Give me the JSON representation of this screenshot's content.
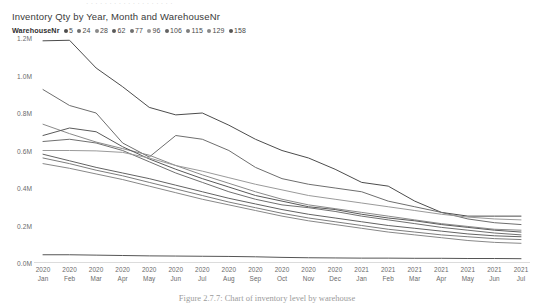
{
  "top_cut_text": "· · · · · · · · · · · · · · · · · · ·",
  "caption": "Figure 2.7.7: Chart of inventory level by warehouse",
  "chart": {
    "title": "Inventory Qty by Year, Month and WarehouseNr",
    "legend_title": "WarehouseNr"
  },
  "chart_data": {
    "type": "line",
    "title": "Inventory Qty by Year, Month and WarehouseNr",
    "xlabel": "",
    "ylabel": "",
    "ylim": [
      0,
      1200000
    ],
    "ytick_labels": [
      "1.2M",
      "1.0M",
      "0.8M",
      "0.6M",
      "0.4M",
      "0.2M",
      "0.0M"
    ],
    "ytick_values": [
      1200000,
      1000000,
      800000,
      600000,
      400000,
      200000,
      0
    ],
    "grid": false,
    "legend_position": "top-left",
    "legend_title": "WarehouseNr",
    "categories": [
      "2020 Jan",
      "2020 Feb",
      "2020 Mar",
      "2020 Apr",
      "2020 May",
      "2020 Jun",
      "2020 Jul",
      "2020 Aug",
      "2020 Sep",
      "2020 Oct",
      "2020 Nov",
      "2020 Dec",
      "2021 Jan",
      "2021 Feb",
      "2021 Mar",
      "2021 Apr",
      "2021 May",
      "2021 Jun",
      "2021 Jul"
    ],
    "x_tick_years": [
      "2020",
      "2020",
      "2020",
      "2020",
      "2020",
      "2020",
      "2020",
      "2020",
      "2020",
      "2020",
      "2020",
      "2020",
      "2021",
      "2021",
      "2021",
      "2021",
      "2021",
      "2021",
      "2021"
    ],
    "x_tick_months": [
      "Jan",
      "Feb",
      "Mar",
      "Apr",
      "May",
      "Jun",
      "Jul",
      "Aug",
      "Sep",
      "Oct",
      "Nov",
      "Dec",
      "Jan",
      "Feb",
      "Mar",
      "Apr",
      "May",
      "Jun",
      "Jul"
    ],
    "series": [
      {
        "name": "5",
        "color": "#4c4c4c",
        "values": [
          1185000,
          1188000,
          1040000,
          940000,
          830000,
          790000,
          800000,
          735000,
          660000,
          600000,
          560000,
          500000,
          430000,
          410000,
          330000,
          270000,
          250000,
          250000,
          250000
        ]
      },
      {
        "name": "24",
        "color": "#6e6e6e",
        "values": [
          925000,
          840000,
          800000,
          640000,
          565000,
          680000,
          660000,
          600000,
          510000,
          450000,
          420000,
          400000,
          380000,
          330000,
          300000,
          270000,
          235000,
          215000,
          205000
        ]
      },
      {
        "name": "28",
        "color": "#8a8a8a",
        "values": [
          740000,
          690000,
          645000,
          610000,
          575000,
          520000,
          470000,
          425000,
          380000,
          340000,
          310000,
          290000,
          270000,
          250000,
          230000,
          210000,
          195000,
          180000,
          175000
        ]
      },
      {
        "name": "62",
        "color": "#5a5a5a",
        "values": [
          680000,
          720000,
          700000,
          620000,
          555000,
          500000,
          450000,
          405000,
          360000,
          330000,
          300000,
          285000,
          260000,
          240000,
          225000,
          205000,
          190000,
          175000,
          165000
        ]
      },
      {
        "name": "77",
        "color": "#707070",
        "values": [
          648000,
          660000,
          640000,
          600000,
          540000,
          480000,
          430000,
          380000,
          340000,
          310000,
          295000,
          275000,
          250000,
          230000,
          210000,
          190000,
          175000,
          160000,
          150000
        ]
      },
      {
        "name": "96",
        "color": "#9a9a9a",
        "values": [
          600000,
          600000,
          598000,
          590000,
          560000,
          520000,
          490000,
          455000,
          420000,
          390000,
          360000,
          340000,
          320000,
          300000,
          280000,
          260000,
          245000,
          235000,
          230000
        ]
      },
      {
        "name": "106",
        "color": "#636363",
        "values": [
          580000,
          545000,
          510000,
          480000,
          450000,
          415000,
          380000,
          345000,
          315000,
          285000,
          260000,
          240000,
          220000,
          200000,
          185000,
          170000,
          155000,
          145000,
          140000
        ]
      },
      {
        "name": "115",
        "color": "#7d7d7d",
        "values": [
          560000,
          530000,
          495000,
          465000,
          430000,
          395000,
          360000,
          325000,
          295000,
          265000,
          240000,
          220000,
          200000,
          180000,
          165000,
          150000,
          140000,
          130000,
          125000
        ]
      },
      {
        "name": "129",
        "color": "#888888",
        "values": [
          530000,
          505000,
          475000,
          445000,
          410000,
          375000,
          340000,
          310000,
          280000,
          250000,
          225000,
          205000,
          185000,
          165000,
          150000,
          135000,
          120000,
          110000,
          105000
        ]
      },
      {
        "name": "158",
        "color": "#555555",
        "values": [
          44000,
          44000,
          42000,
          40000,
          38000,
          37000,
          36000,
          35000,
          33000,
          30000,
          28000,
          27000,
          26000,
          26000,
          25000,
          25000,
          24000,
          24000,
          23000
        ]
      }
    ]
  }
}
